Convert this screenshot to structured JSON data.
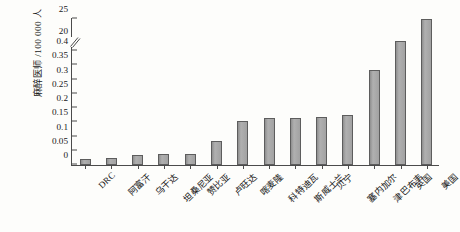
{
  "chart_data": {
    "type": "bar",
    "title": "",
    "xlabel": "",
    "ylabel": "麻醉医师 /100 000 人",
    "categories": [
      "DRC",
      "阿富汗",
      "乌干达",
      "坦桑尼亚",
      "赞比亚",
      "卢旺达",
      "喀麦隆",
      "科特迪瓦",
      "斯威士兰",
      "贝宁",
      "塞内加尔",
      "津巴布韦",
      "英国",
      "美国"
    ],
    "values": [
      0.02,
      0.025,
      0.035,
      0.04,
      0.04,
      0.085,
      0.155,
      0.165,
      0.165,
      0.17,
      0.175,
      0.335,
      20,
      25
    ],
    "axis_break": true,
    "break_between": [
      0.4,
      20
    ],
    "lower_ticks": [
      "0",
      "0.05",
      "0.1",
      "0.15",
      "0.2",
      "0.25",
      "0.3",
      "0.35",
      "0.4"
    ],
    "lower_tick_values": [
      0,
      0.05,
      0.1,
      0.15,
      0.2,
      0.25,
      0.3,
      0.35,
      0.4
    ],
    "upper_ticks": [
      "20",
      "25"
    ],
    "upper_tick_values": [
      20,
      25
    ],
    "ylim_lower": [
      0,
      0.4
    ],
    "ylim_upper": [
      20,
      25
    ],
    "grid": false,
    "legend": null,
    "bar_color": "#a3a3a3",
    "bar_edge_color": "#5d5d5d",
    "axis_color": "#4b4b4b"
  }
}
